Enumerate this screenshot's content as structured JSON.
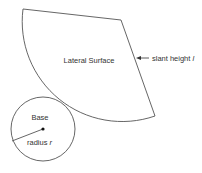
{
  "diagram": {
    "colors": {
      "stroke": "#555555",
      "text": "#333333",
      "background": "#ffffff"
    },
    "lateral_surface": {
      "label": "Lateral Surface",
      "shape": "circular sector",
      "apex": [
        121,
        20
      ],
      "arc_start": [
        23,
        9
      ],
      "arc_end": [
        155,
        116
      ]
    },
    "slant_height": {
      "label_prefix": "slant height ",
      "label_var": "l",
      "arrow_direction": "left"
    },
    "base": {
      "label": "Base",
      "shape": "circle",
      "center": [
        43,
        129
      ],
      "radius_px": 32
    },
    "radius": {
      "label_prefix": "radius ",
      "label_var": "r"
    }
  }
}
